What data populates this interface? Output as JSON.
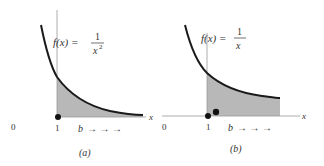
{
  "panels": [
    {
      "id": "a",
      "caption": "(a)",
      "function_label": "f(x) =",
      "numerator": "1",
      "denominator": "x",
      "exponent": "2",
      "origin_label": "0",
      "tick_label": "1",
      "x_axis_label": "x",
      "limit_label": "b",
      "arrows": "→ → →"
    },
    {
      "id": "b",
      "caption": "(b)",
      "function_label": "f(x) =",
      "numerator": "1",
      "denominator": "x",
      "origin_label": "0",
      "tick_label": "1",
      "x_axis_label": "x",
      "limit_label": "b",
      "arrows": "→ → →"
    }
  ],
  "colors": {
    "curve": "#1a1a1a",
    "shade": "#b8b8b8",
    "axis": "#888888"
  }
}
